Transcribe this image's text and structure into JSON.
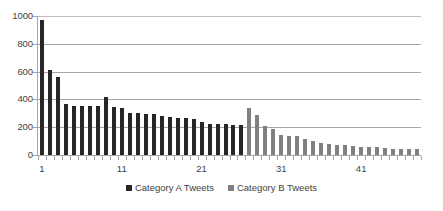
{
  "chart_data": {
    "type": "bar",
    "title": "",
    "subtitle": "",
    "xlabel": "",
    "ylabel": "",
    "ylim": [
      0,
      1000
    ],
    "y_ticks": [
      0,
      200,
      400,
      600,
      800,
      1000
    ],
    "y_tick_labels": [
      "0",
      "200",
      "400",
      "600",
      "800",
      "1000"
    ],
    "grid": true,
    "grid_axis": "y",
    "legend_position": "bottom",
    "x_tick_labels": [
      "1",
      "11",
      "21",
      "31",
      "41"
    ],
    "x_tick_positions": [
      1,
      11,
      21,
      31,
      41
    ],
    "x": [
      1,
      2,
      3,
      4,
      5,
      6,
      7,
      8,
      9,
      10,
      11,
      12,
      13,
      14,
      15,
      16,
      17,
      18,
      19,
      20,
      21,
      22,
      23,
      24,
      25,
      26,
      27,
      28,
      29,
      30,
      31,
      32,
      33,
      34,
      35,
      36,
      37,
      38,
      39,
      40,
      41,
      42,
      43,
      44,
      45,
      46,
      47,
      48
    ],
    "series": [
      {
        "name": "Category A Tweets",
        "color": "#262626",
        "values": [
          970,
          610,
          560,
          365,
          355,
          350,
          355,
          350,
          420,
          345,
          340,
          300,
          300,
          295,
          295,
          280,
          270,
          265,
          265,
          260,
          240,
          225,
          225,
          220,
          215,
          215,
          null,
          null,
          null,
          null,
          null,
          null,
          null,
          null,
          null,
          null,
          null,
          null,
          null,
          null,
          null,
          null,
          null,
          null,
          null,
          null,
          null,
          null
        ]
      },
      {
        "name": "Category B Tweets",
        "color": "#808080",
        "values": [
          null,
          null,
          null,
          null,
          null,
          null,
          null,
          null,
          null,
          null,
          null,
          null,
          null,
          null,
          null,
          null,
          null,
          null,
          null,
          null,
          null,
          null,
          null,
          null,
          null,
          null,
          335,
          285,
          210,
          185,
          145,
          140,
          135,
          115,
          100,
          85,
          80,
          75,
          70,
          65,
          60,
          55,
          55,
          50,
          45,
          45,
          40,
          40
        ]
      }
    ]
  },
  "legend": {
    "items": [
      {
        "label": "Category A Tweets",
        "color": "#262626"
      },
      {
        "label": "Category B Tweets",
        "color": "#808080"
      }
    ]
  },
  "colors": {
    "category_a": "#262626",
    "category_b": "#808080",
    "gridline": "#a6a6a6",
    "text": "#3f3f3f",
    "background": "#ffffff"
  }
}
